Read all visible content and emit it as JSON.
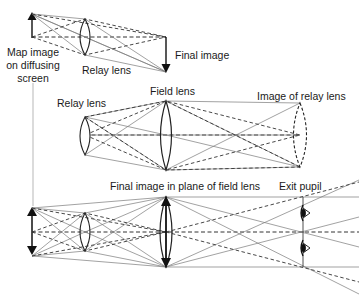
{
  "diagram": {
    "colors": {
      "background": "#ffffff",
      "ray_solid": "#7a7a7a",
      "ray_dashed": "#333333",
      "lens": "#222222",
      "arrow": "#111111",
      "text": "#1a1a1a"
    },
    "panels": [
      {
        "id": "top",
        "description": "Relay lens forms inverted final image of map on diffusing screen",
        "labels": {
          "object": [
            "Map image",
            "on diffusing",
            "screen"
          ],
          "lens": "Relay lens",
          "image": "Final image"
        }
      },
      {
        "id": "middle",
        "description": "Field lens forms image of relay lens",
        "labels": {
          "relay_lens": "Relay lens",
          "field_lens": "Field lens",
          "relay_image": "Image of relay lens"
        }
      },
      {
        "id": "bottom",
        "description": "Complete system with final image in plane of field lens and exit pupil with eyes",
        "labels": {
          "final_image": "Final image in plane of field lens",
          "exit_pupil": "Exit pupil"
        }
      }
    ],
    "labels": {
      "map_image_line1": "Map image",
      "map_image_line2": "on diffusing",
      "map_image_line3": "screen",
      "relay_lens_top": "Relay lens",
      "final_image": "Final image",
      "field_lens": "Field lens",
      "relay_lens_middle": "Relay lens",
      "image_of_relay_lens": "Image of relay lens",
      "final_image_in_plane": "Final image in plane of field lens",
      "exit_pupil": "Exit pupil"
    }
  }
}
